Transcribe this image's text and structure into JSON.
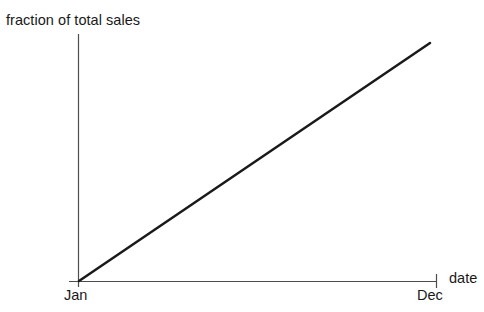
{
  "chart_data": {
    "type": "line",
    "title": "",
    "ylabel": "fraction of total sales",
    "xlabel": "date",
    "categories": [
      "Jan",
      "Dec"
    ],
    "xticklabels": [
      "Jan",
      "Dec"
    ],
    "yticklabels": [],
    "x": [
      0,
      1
    ],
    "values": [
      0,
      1
    ],
    "series": [
      {
        "name": "fraction of total sales",
        "x": [
          0,
          1
        ],
        "values": [
          0,
          1
        ]
      }
    ],
    "xlim": [
      0,
      1
    ],
    "ylim": [
      0,
      1
    ],
    "grid": false,
    "legend": false,
    "legend_position": "none",
    "annotations": [],
    "style": {
      "background_color": "#ffffff",
      "line_color": "#1a1a1a",
      "axis_color": "#4d4d4d",
      "text_color": "#191919",
      "line_width": 2.5,
      "axis_width": 1.2
    }
  },
  "axes": {
    "y_axis_name": "y-axis-line",
    "x_axis_name": "x-axis-line",
    "origin_tick_name": "jan-tick",
    "end_tick_name": "dec-tick"
  }
}
